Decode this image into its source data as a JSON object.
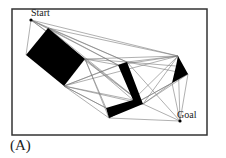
{
  "diagram": {
    "caption": "(A)",
    "frame": {
      "x": 12,
      "y": 9,
      "width": 195,
      "height": 126,
      "stroke": "#333333"
    },
    "colors": {
      "obstacle": "#000000",
      "edge": "#7a7a7a",
      "frame": "#333333",
      "text": "#222222"
    },
    "nodes": {
      "start": {
        "label": "Start",
        "x": 31,
        "y": 20
      },
      "goal": {
        "label": "Goal",
        "x": 180,
        "y": 121
      }
    },
    "obstacles": [
      {
        "name": "rectangle",
        "points": [
          [
            48,
            28
          ],
          [
            85,
            59
          ],
          [
            64,
            86
          ],
          [
            26,
            55
          ]
        ]
      },
      {
        "name": "l-shape",
        "points": [
          [
            118,
            65
          ],
          [
            127,
            62
          ],
          [
            143,
            104
          ],
          [
            109,
            118
          ],
          [
            106,
            108
          ],
          [
            133,
            100
          ]
        ]
      },
      {
        "name": "quadrilateral",
        "points": [
          [
            178,
            56
          ],
          [
            188,
            74
          ],
          [
            172,
            83
          ],
          [
            176,
            66
          ]
        ]
      }
    ],
    "edges": [
      [
        [
          31,
          20
        ],
        [
          48,
          28
        ]
      ],
      [
        [
          31,
          20
        ],
        [
          26,
          55
        ]
      ],
      [
        [
          31,
          20
        ],
        [
          85,
          59
        ]
      ],
      [
        [
          31,
          20
        ],
        [
          118,
          65
        ]
      ],
      [
        [
          31,
          20
        ],
        [
          127,
          62
        ]
      ],
      [
        [
          31,
          20
        ],
        [
          178,
          56
        ]
      ],
      [
        [
          31,
          20
        ],
        [
          143,
          104
        ]
      ],
      [
        [
          48,
          28
        ],
        [
          178,
          56
        ]
      ],
      [
        [
          48,
          28
        ],
        [
          127,
          62
        ]
      ],
      [
        [
          48,
          28
        ],
        [
          118,
          65
        ]
      ],
      [
        [
          48,
          28
        ],
        [
          143,
          104
        ]
      ],
      [
        [
          85,
          59
        ],
        [
          118,
          65
        ]
      ],
      [
        [
          85,
          59
        ],
        [
          127,
          62
        ]
      ],
      [
        [
          85,
          59
        ],
        [
          178,
          56
        ]
      ],
      [
        [
          85,
          59
        ],
        [
          109,
          118
        ]
      ],
      [
        [
          85,
          59
        ],
        [
          106,
          108
        ]
      ],
      [
        [
          85,
          59
        ],
        [
          143,
          104
        ]
      ],
      [
        [
          85,
          59
        ],
        [
          133,
          100
        ]
      ],
      [
        [
          64,
          86
        ],
        [
          118,
          65
        ]
      ],
      [
        [
          64,
          86
        ],
        [
          127,
          62
        ]
      ],
      [
        [
          64,
          86
        ],
        [
          106,
          108
        ]
      ],
      [
        [
          64,
          86
        ],
        [
          109,
          118
        ]
      ],
      [
        [
          64,
          86
        ],
        [
          143,
          104
        ]
      ],
      [
        [
          64,
          86
        ],
        [
          178,
          56
        ]
      ],
      [
        [
          64,
          86
        ],
        [
          133,
          100
        ]
      ],
      [
        [
          127,
          62
        ],
        [
          178,
          56
        ]
      ],
      [
        [
          127,
          62
        ],
        [
          176,
          66
        ]
      ],
      [
        [
          127,
          62
        ],
        [
          180,
          121
        ]
      ],
      [
        [
          127,
          62
        ],
        [
          188,
          74
        ]
      ],
      [
        [
          118,
          65
        ],
        [
          178,
          56
        ]
      ],
      [
        [
          143,
          104
        ],
        [
          178,
          56
        ]
      ],
      [
        [
          143,
          104
        ],
        [
          172,
          83
        ]
      ],
      [
        [
          143,
          104
        ],
        [
          180,
          121
        ]
      ],
      [
        [
          143,
          104
        ],
        [
          188,
          74
        ]
      ],
      [
        [
          133,
          100
        ],
        [
          178,
          56
        ]
      ],
      [
        [
          109,
          118
        ],
        [
          180,
          121
        ]
      ],
      [
        [
          109,
          118
        ],
        [
          172,
          83
        ]
      ],
      [
        [
          109,
          118
        ],
        [
          188,
          74
        ]
      ],
      [
        [
          178,
          56
        ],
        [
          180,
          121
        ]
      ],
      [
        [
          188,
          74
        ],
        [
          180,
          121
        ]
      ],
      [
        [
          172,
          83
        ],
        [
          180,
          121
        ]
      ],
      [
        [
          106,
          108
        ],
        [
          64,
          86
        ]
      ]
    ]
  }
}
